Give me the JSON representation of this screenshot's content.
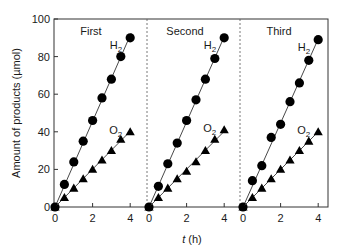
{
  "chart_data": {
    "type": "scatter",
    "title": "",
    "xlabel": "t (h)",
    "xlabel_italic_part": "t",
    "xlabel_unit_part": " (h)",
    "ylabel": "Amount of products (µmol)",
    "ylim": [
      0,
      100
    ],
    "yticks": [
      0,
      20,
      40,
      60,
      80,
      100
    ],
    "xlim_per_panel": [
      0,
      4.4
    ],
    "xticks_per_panel": [
      0,
      2,
      4
    ],
    "grid": false,
    "legend": "inline labels near end of each series",
    "panels": [
      {
        "label": "First",
        "series": [
          {
            "name": "H2",
            "marker": "circle",
            "x": [
              0,
              0.5,
              1,
              1.5,
              2,
              2.5,
              3,
              3.5,
              4
            ],
            "y": [
              0,
              12,
              24,
              35,
              46,
              58,
              68,
              80,
              90
            ]
          },
          {
            "name": "O2",
            "marker": "triangle",
            "x": [
              0,
              0.5,
              1,
              1.5,
              2,
              2.5,
              3,
              3.5,
              4
            ],
            "y": [
              0,
              5,
              10,
              15,
              20,
              25,
              30,
              36,
              40
            ]
          }
        ]
      },
      {
        "label": "Second",
        "series": [
          {
            "name": "H2",
            "marker": "circle",
            "x": [
              0,
              0.5,
              1,
              1.5,
              2,
              2.5,
              3,
              3.5,
              4
            ],
            "y": [
              0,
              11,
              23,
              34,
              46,
              57,
              68,
              79,
              90
            ]
          },
          {
            "name": "O2",
            "marker": "triangle",
            "x": [
              0,
              0.5,
              1,
              1.5,
              2,
              2.5,
              3,
              3.5,
              4
            ],
            "y": [
              0,
              5,
              10,
              15,
              19,
              24,
              30,
              36,
              41
            ]
          }
        ]
      },
      {
        "label": "Third",
        "series": [
          {
            "name": "H2",
            "marker": "circle",
            "x": [
              0,
              0.5,
              1,
              1.5,
              2,
              2.5,
              3,
              3.5,
              4
            ],
            "y": [
              0,
              14,
              22,
              37,
              44,
              56,
              66,
              78,
              89
            ]
          },
          {
            "name": "O2",
            "marker": "triangle",
            "x": [
              0,
              0.5,
              1,
              1.5,
              2,
              2.5,
              3,
              3.5,
              4
            ],
            "y": [
              0,
              5,
              10,
              15,
              20,
              25,
              30,
              35,
              40
            ]
          }
        ]
      }
    ]
  },
  "layout": {
    "plot_left": 54,
    "plot_right": 328,
    "plot_top": 19,
    "plot_bottom": 207,
    "panel_x0": [
      55,
      149,
      243
    ],
    "panel_px_per_hour": 18.8,
    "dividers": [
      147,
      240
    ]
  },
  "colors": {
    "marker": "#000000",
    "line": "#333333",
    "axis": "#333333",
    "divider": "#555555"
  }
}
